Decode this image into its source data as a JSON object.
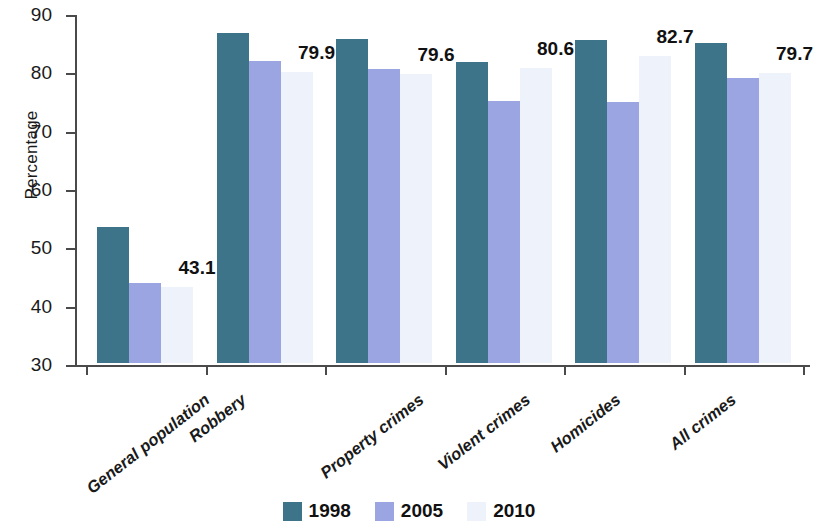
{
  "chart_data": {
    "type": "bar",
    "title": "",
    "xlabel": "",
    "ylabel": "Percentage",
    "ylim": [
      30,
      90
    ],
    "yticks": [
      30,
      40,
      50,
      60,
      70,
      80,
      90
    ],
    "ytick_labels": [
      "30",
      "40",
      "50",
      "60",
      "70",
      "80",
      "90"
    ],
    "grid": false,
    "legend_position": "bottom-center",
    "categories": [
      "General population",
      "Robbery",
      "Property crimes",
      "Violent crimes",
      "Homicides",
      "All crimes"
    ],
    "series": [
      {
        "name": "1998",
        "color": "#3d7489",
        "values": [
          53.4,
          86.6,
          85.6,
          81.6,
          85.3,
          84.8
        ]
      },
      {
        "name": "2005",
        "color": "#9aa5e2",
        "values": [
          43.7,
          81.7,
          80.4,
          75.0,
          74.8,
          78.8
        ]
      },
      {
        "name": "2010",
        "color": "#eef2fa",
        "values": [
          43.1,
          79.9,
          79.6,
          80.6,
          82.7,
          79.7
        ]
      }
    ],
    "data_labels": {
      "series": "2010",
      "values": [
        "43.1",
        "79.9",
        "79.6",
        "80.6",
        "82.7",
        "79.7"
      ]
    }
  },
  "legend": {
    "items": [
      {
        "label": "1998",
        "color": "#3d7489"
      },
      {
        "label": "2005",
        "color": "#9aa5e2"
      },
      {
        "label": "2010",
        "color": "#eef2fa"
      }
    ]
  }
}
